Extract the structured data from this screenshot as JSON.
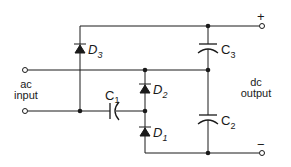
{
  "diagram": {
    "type": "voltage-tripler-rectifier-circuit",
    "labels": {
      "ac_input_line1": "ac",
      "ac_input_line2": "input",
      "dc_output_line1": "dc",
      "dc_output_line2": "output",
      "plus": "+",
      "minus": "−"
    },
    "components": {
      "D1": {
        "letter": "D",
        "sub": "1"
      },
      "D2": {
        "letter": "D",
        "sub": "2"
      },
      "D3": {
        "letter": "D",
        "sub": "3"
      },
      "C1": {
        "letter": "C",
        "sub": "1"
      },
      "C2": {
        "letter": "C",
        "sub": "2"
      },
      "C3": {
        "letter": "C",
        "sub": "3"
      }
    },
    "colors": {
      "line": "#1a1a1a",
      "background": "#ffffff"
    }
  }
}
